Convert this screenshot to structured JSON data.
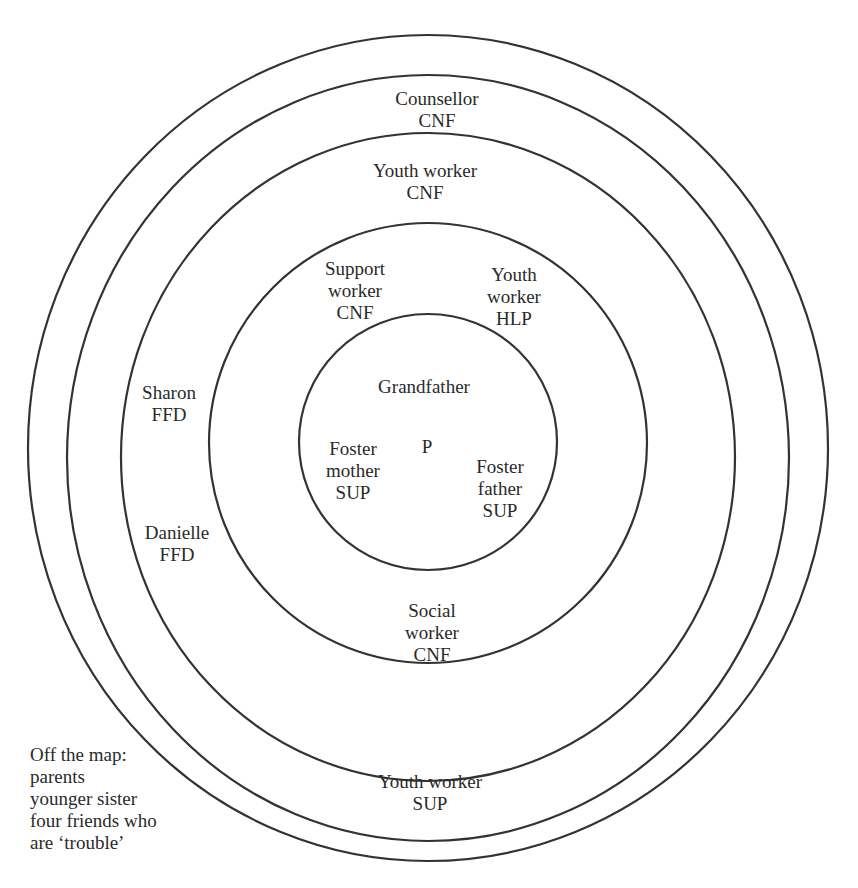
{
  "diagram": {
    "type": "concentric-support-map",
    "center_label": "P",
    "rings": [
      {
        "name": "inner",
        "cx": 428,
        "cy": 442,
        "rx": 129,
        "ry": 128
      },
      {
        "name": "second",
        "cx": 428,
        "cy": 443,
        "rx": 219,
        "ry": 220
      },
      {
        "name": "third",
        "cx": 428,
        "cy": 457,
        "rx": 307,
        "ry": 324
      },
      {
        "name": "fourth",
        "cx": 428,
        "cy": 458,
        "rx": 361,
        "ry": 383
      },
      {
        "name": "outer",
        "cx": 428,
        "cy": 448,
        "rx": 400,
        "ry": 413
      }
    ],
    "stroke_color": "#333333",
    "labels": {
      "counsellor": [
        "Counsellor",
        "CNF"
      ],
      "youth_worker_cnf": [
        "Youth worker",
        "CNF"
      ],
      "support_worker": [
        "Support",
        "worker",
        "CNF"
      ],
      "youth_worker_hlp": [
        "Youth",
        "worker",
        "HLP"
      ],
      "grandfather": [
        "Grandfather"
      ],
      "foster_mother": [
        "Foster",
        "mother",
        "SUP"
      ],
      "foster_father": [
        "Foster",
        "father",
        "SUP"
      ],
      "sharon": [
        "Sharon",
        "FFD"
      ],
      "danielle": [
        "Danielle",
        "FFD"
      ],
      "social_worker": [
        "Social",
        "worker",
        "CNF"
      ],
      "youth_worker_sup": [
        "Youth worker",
        "SUP"
      ]
    },
    "off_map": {
      "title": "Off the map:",
      "items": [
        "parents",
        "younger sister",
        "four friends who",
        "are ‘trouble’"
      ]
    }
  }
}
